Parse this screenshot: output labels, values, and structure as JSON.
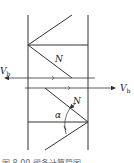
{
  "diagram": {
    "labels": {
      "shear_left": "V",
      "shear_left_sub": "b",
      "shear_right": "V",
      "shear_right_sub": "b",
      "axial_upper": "N",
      "axial_lower": "N",
      "angle": "α"
    },
    "caption": "图 8.00  缀条计算简图",
    "colors": {
      "line": "#333333",
      "caption": "#777777"
    }
  }
}
